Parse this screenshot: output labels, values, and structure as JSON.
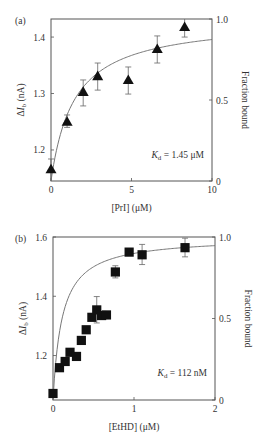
{
  "chart_data": [
    {
      "type": "scatter",
      "panel_label": "(a)",
      "title": "",
      "xlabel": "[PrI] (μM)",
      "ylabel": "ΔI_b (nA)",
      "ylabel_parts": {
        "delta": "Δ",
        "var": "I",
        "sub": "b",
        "unit": " (nA)"
      },
      "y2label": "Fraction bound",
      "xlim": [
        0,
        10
      ],
      "ylim": [
        1.145,
        1.432
      ],
      "y2lim": [
        0,
        1.0
      ],
      "xticks": [
        0,
        5,
        10
      ],
      "yticks": [
        1.2,
        1.3,
        1.4
      ],
      "y2ticks": [
        0,
        0.5,
        1.0
      ],
      "xtick_labels": [
        "0",
        "5",
        "10"
      ],
      "ytick_labels": [
        "1.2",
        "1.3",
        "1.4"
      ],
      "y2tick_labels": [
        "0",
        "0.5",
        "1.0"
      ],
      "marker": "triangle",
      "annotation": {
        "K": "K",
        "sub": "d",
        "rest": " = 1.45 μM",
        "text": "K_d = 1.45 μM"
      },
      "kd": 1.45,
      "grid": false,
      "legend": null,
      "series": [
        {
          "name": "measured",
          "x": [
            0,
            1.0,
            2.0,
            2.9,
            4.8,
            6.6,
            8.3
          ],
          "y": [
            1.166,
            1.25,
            1.303,
            1.331,
            1.324,
            1.379,
            1.418
          ],
          "err_low": [
            1.145,
            1.24,
            1.278,
            1.306,
            1.299,
            1.354,
            1.4
          ],
          "err_high": [
            1.184,
            1.262,
            1.324,
            1.354,
            1.347,
            1.402,
            1.432
          ]
        },
        {
          "name": "fit",
          "type": "line",
          "equation": "fraction = x / (x + Kd)",
          "y_at_x0": 1.145,
          "y_at_xmax": 1.396
        }
      ],
      "frame": {
        "left": 51,
        "top": 19,
        "right": 212,
        "bottom": 181
      }
    },
    {
      "type": "scatter",
      "panel_label": "(b)",
      "title": "",
      "xlabel": "[EtHD] (μM)",
      "ylabel": "ΔI_b (nA)",
      "ylabel_parts": {
        "delta": "Δ",
        "var": "I",
        "sub": "b",
        "unit": " (nA)"
      },
      "y2label": "Fraction bound",
      "xlim": [
        0,
        2
      ],
      "ylim": [
        1.05,
        1.6
      ],
      "y2lim": [
        0,
        1.0
      ],
      "xticks": [
        0,
        1,
        2
      ],
      "yticks": [
        1.2,
        1.4,
        1.6
      ],
      "y2ticks": [
        0,
        0.5,
        1.0
      ],
      "xtick_labels": [
        "0",
        "1",
        "2"
      ],
      "ytick_labels": [
        "1.2",
        "1.4",
        "1.6"
      ],
      "y2tick_labels": [
        "0",
        "0.5",
        "1.0"
      ],
      "marker": "square",
      "annotation": {
        "K": "K",
        "sub": "d",
        "rest": " = 112 nM",
        "text": "K_d = 112 nM"
      },
      "kd": 0.112,
      "grid": false,
      "legend": null,
      "series": [
        {
          "name": "measured",
          "x": [
            0.0,
            0.08,
            0.15,
            0.21,
            0.29,
            0.35,
            0.41,
            0.48,
            0.54,
            0.6,
            0.66,
            0.77,
            0.94,
            1.1,
            1.63
          ],
          "y": [
            1.072,
            1.159,
            1.18,
            1.211,
            1.197,
            1.251,
            1.287,
            1.329,
            1.354,
            1.335,
            1.337,
            1.482,
            1.549,
            1.54,
            1.564
          ],
          "err_low": [
            null,
            null,
            null,
            null,
            null,
            null,
            null,
            null,
            1.31,
            null,
            null,
            1.462,
            null,
            1.507,
            1.533
          ],
          "err_high": [
            null,
            null,
            null,
            null,
            null,
            null,
            null,
            null,
            1.399,
            null,
            null,
            1.503,
            null,
            1.575,
            1.596
          ]
        },
        {
          "name": "fit",
          "type": "line",
          "equation": "fraction = x / (x + Kd)",
          "y_at_x0": 1.05,
          "y_at_xmax": 1.571
        }
      ],
      "frame": {
        "left": 53,
        "top": 237,
        "right": 215,
        "bottom": 400
      }
    }
  ]
}
